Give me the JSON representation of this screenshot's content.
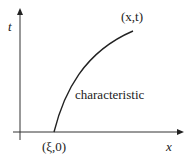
{
  "diagram": {
    "type": "characteristic-curve",
    "axes": {
      "horizontal_label": "x",
      "vertical_label": "t"
    },
    "labels": {
      "curve_end": "(x,t)",
      "curve_start": "(ξ,0)",
      "curve_name": "characteristic"
    },
    "colors": {
      "line": "#222222",
      "background": "#ffffff"
    }
  }
}
